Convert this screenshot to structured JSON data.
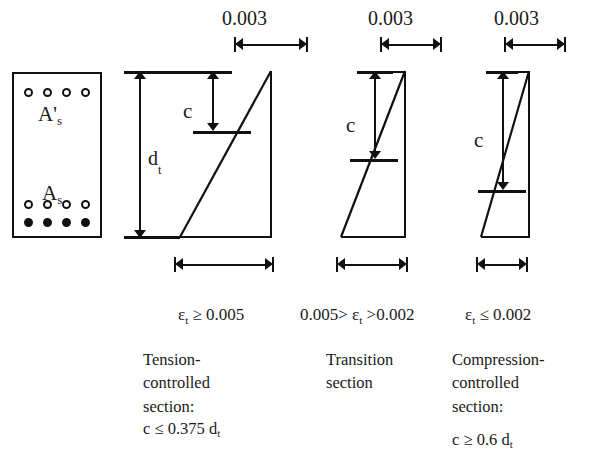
{
  "figure": {
    "cross_section": {
      "top_steel_label": "A'",
      "top_steel_sub": "s",
      "bottom_steel_label": "A",
      "bottom_steel_sub": "s",
      "top_bar_count": 4,
      "bottom_row1_bar_count": 4,
      "bottom_row2_bar_count": 4,
      "depth_label": "d",
      "depth_sub": "t"
    },
    "cases": [
      {
        "id": "tension-controlled",
        "top_strain_value": "0.003",
        "neutral_axis_label": "c",
        "strain_condition_prefix": "ε",
        "strain_condition_sub": "t",
        "strain_condition_rest": " ≥ 0.005",
        "caption": "Tension-\ncontrolled\nsection:",
        "formula_prefix": "c  ≤  0.375 d",
        "formula_sub": "t"
      },
      {
        "id": "transition",
        "top_strain_value": "0.003",
        "neutral_axis_label": "c",
        "strain_condition_prefix": "0.005> ε",
        "strain_condition_sub": "t",
        "strain_condition_rest": "  >0.002",
        "caption": "Transition\nsection",
        "formula_prefix": "",
        "formula_sub": ""
      },
      {
        "id": "compression-controlled",
        "top_strain_value": "0.003",
        "neutral_axis_label": "c",
        "strain_condition_prefix": "ε",
        "strain_condition_sub": "t",
        "strain_condition_rest": " ≤ 0.002",
        "caption": "Compression-\ncontrolled\nsection:",
        "formula_prefix": "c  ≥  0.6 d",
        "formula_sub": "t"
      }
    ],
    "colors": {
      "ink": "#111111",
      "background": "#ffffff"
    }
  }
}
